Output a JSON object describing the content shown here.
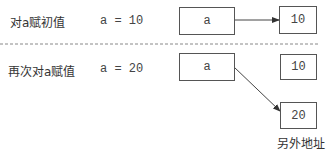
{
  "rows": [
    {
      "label": "对a赋初值",
      "code": "a = 10",
      "var_box": "a",
      "value_box": "10"
    },
    {
      "label": "再次对a赋值",
      "code": "a = 20",
      "var_box": "a",
      "old_value_box": "10",
      "new_value_box": "20",
      "new_value_caption": "另外地址"
    }
  ],
  "colors": {
    "line": "#444444",
    "divider": "#888888",
    "text": "#333333"
  }
}
